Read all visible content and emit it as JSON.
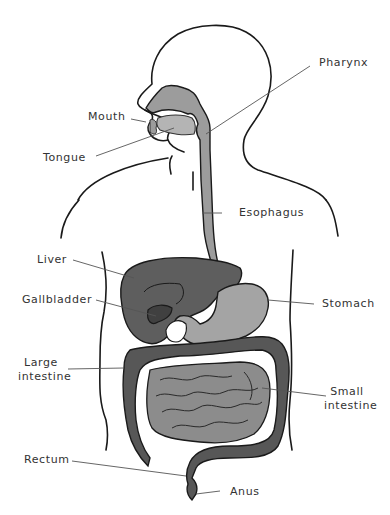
{
  "diagram": {
    "type": "anatomy",
    "colors": {
      "outline": "#1a1a1a",
      "leader_line": "#555555",
      "esophagus_stomach": "#9c9c9c",
      "liver": "#5e5e5e",
      "gallbladder": "#404040",
      "large_intestine": "#575757",
      "small_intestine": "#8c8c8c",
      "background": "#ffffff"
    },
    "labels": {
      "pharynx": "Pharynx",
      "mouth": "Mouth",
      "tongue": "Tongue",
      "esophagus": "Esophagus",
      "liver": "Liver",
      "gallbladder": "Gallbladder",
      "stomach": "Stomach",
      "large_intestine_1": "Large",
      "large_intestine_2": "intestine",
      "small_intestine_1": "Small",
      "small_intestine_2": "intestine",
      "rectum": "Rectum",
      "anus": "Anus"
    }
  }
}
